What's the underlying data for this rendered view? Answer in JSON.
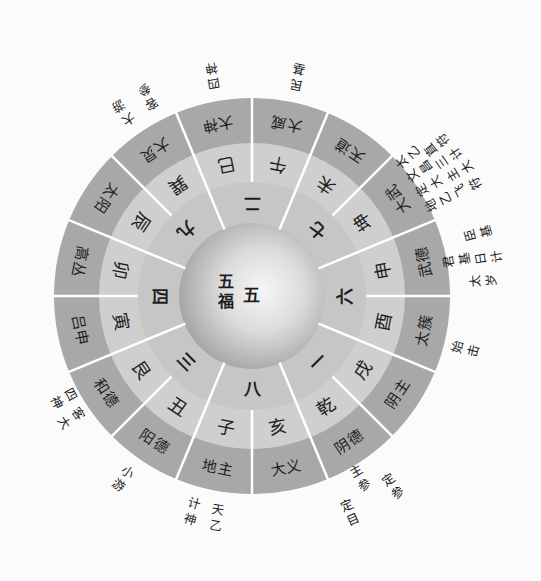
{
  "diagram": {
    "center": {
      "palace_number": "五",
      "label": "五福"
    },
    "palace_numbers": [
      "二",
      "七",
      "六",
      "一",
      "八",
      "三",
      "四",
      "九"
    ],
    "branches": [
      "午",
      "未",
      "坤",
      "申",
      "酉",
      "戌",
      "乾",
      "亥",
      "子",
      "丑",
      "艮",
      "寅",
      "卯",
      "辰",
      "巽",
      "巳"
    ],
    "spirits": [
      "大威",
      "天道",
      "大武",
      "武德",
      "太簇",
      "阴主",
      "阴德",
      "大义",
      "地主",
      "阳德",
      "和德",
      "吕申",
      "高丛",
      "太阳",
      "大炅",
      "大神"
    ],
    "annotations": [
      {
        "text": "民基"
      },
      {
        "text": "太乙"
      },
      {
        "text": "直符"
      },
      {
        "text": "文昌"
      },
      {
        "text": "三计"
      },
      {
        "text": "定大"
      },
      {
        "text": "主大"
      },
      {
        "text": "地乙"
      },
      {
        "text": "飞符"
      },
      {
        "text": "臣基"
      },
      {
        "text": "君基"
      },
      {
        "text": "日计"
      },
      {
        "text": "太岁"
      },
      {
        "text": "始击"
      },
      {
        "text": "定参"
      },
      {
        "text": "主参"
      },
      {
        "text": "定目"
      },
      {
        "text": "天乙"
      },
      {
        "text": "计神"
      },
      {
        "text": "小游"
      },
      {
        "text": "客大"
      },
      {
        "text": "四神"
      },
      {
        "text": "大游"
      },
      {
        "text": "客参"
      },
      {
        "text": "四神"
      }
    ]
  },
  "colors": {
    "background": "#fbfbfb",
    "outer_ring": "#a8a8a8",
    "middle_ring": "#cfcfcf",
    "inner_ring": "#c6c6c6",
    "divider": "#ffffff",
    "text": "#1e1e1e"
  }
}
